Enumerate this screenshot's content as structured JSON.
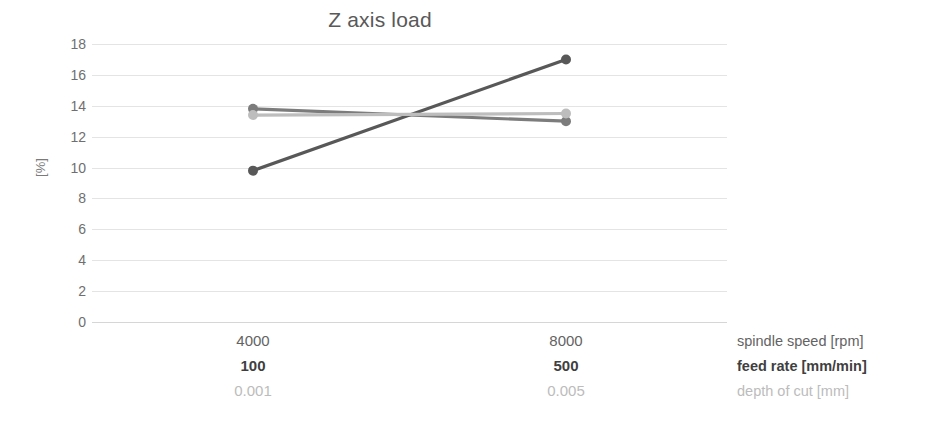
{
  "chart_data": {
    "type": "line",
    "title": "Z axis load",
    "xlabel": "",
    "ylabel": "[%]",
    "ylim": [
      0,
      18
    ],
    "ytick_step": 2,
    "yticks": [
      18,
      16,
      14,
      12,
      10,
      8,
      6,
      4,
      2,
      0
    ],
    "grid": true,
    "legend_position": "right-axis-titles",
    "x": [
      1,
      2
    ],
    "categories": [
      "4000",
      "8000"
    ],
    "category_rows": [
      {
        "name": "spindle speed [rpm]",
        "values": [
          "4000",
          "8000"
        ],
        "color": "#636363",
        "weight": "normal"
      },
      {
        "name": "feed rate [mm/min]",
        "values": [
          "100",
          "500"
        ],
        "color": "#3f3f3f",
        "weight": "bold"
      },
      {
        "name": "depth of cut [mm]",
        "values": [
          "0.001",
          "0.005"
        ],
        "color": "#bcbcbc",
        "weight": "normal"
      }
    ],
    "series": [
      {
        "name": "spindle speed [rpm]",
        "values": [
          13.8,
          13.0
        ],
        "color": "#7c7c7c"
      },
      {
        "name": "feed rate [mm/min]",
        "values": [
          9.8,
          17.0
        ],
        "color": "#585858"
      },
      {
        "name": "depth of cut [mm]",
        "values": [
          13.4,
          13.5
        ],
        "color": "#bdbdbd"
      }
    ]
  },
  "legend": {
    "items": [
      {
        "label": "spindle speed [rpm]",
        "shade": "mid"
      },
      {
        "label": "feed rate [mm/min]",
        "shade": "dark"
      },
      {
        "label": "depth of cut [mm]",
        "shade": "light"
      }
    ]
  },
  "colors": {
    "title": "#595959",
    "tick_label": "#6f6f6f",
    "gridline": "#e4e4e4",
    "background": "#ffffff"
  }
}
